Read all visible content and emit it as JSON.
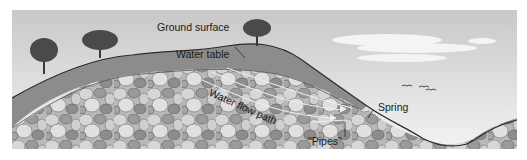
{
  "diagram": {
    "type": "groundwater cross-section",
    "labels": {
      "ground_surface": "Ground surface",
      "water_table": "Water table",
      "water_flow_path": "Water flow path",
      "pipes": "\"Pipes\"",
      "spring": "Spring"
    },
    "elements": [
      "sky",
      "clouds",
      "birds",
      "trees",
      "soil-layer",
      "rock-aquifer",
      "flow-arrows",
      "valley"
    ],
    "colors": {
      "sky_top": "#c9c9c9",
      "sky_bottom": "#f2f2f2",
      "soil": "#8f8f8f",
      "rock_fill": "#bdbdbd",
      "rock_dark": "#8a8a8a",
      "outline": "#2b2b2b",
      "tree": "#4a4a4a"
    }
  }
}
